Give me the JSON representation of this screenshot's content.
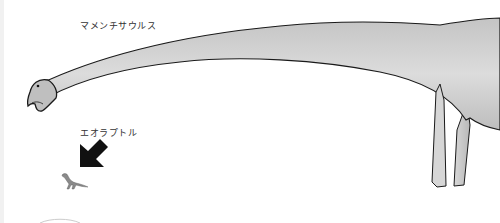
{
  "figure": {
    "type": "size-comparison-illustration",
    "labels": {
      "large_dinosaur": "マメンチサウルス",
      "small_dinosaur": "エオラプトル"
    },
    "arrow": {
      "direction": "down-left",
      "color": "#111111"
    },
    "colors": {
      "background": "#ffffff",
      "body_fill_light": "#e2e2e2",
      "body_fill_dark": "#bdbdbd",
      "outline": "#1a1a1a",
      "label_text": "#333333"
    }
  }
}
